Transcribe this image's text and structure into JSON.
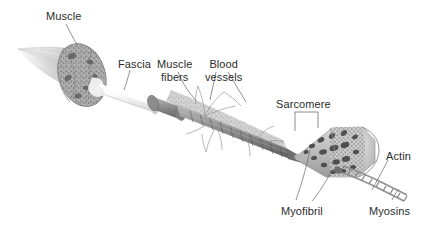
{
  "diagram": {
    "title_visible": false,
    "palette": {
      "background": "#ffffff",
      "text": "#2b2b2b",
      "leader_line": "#6e6e6e",
      "muscle_light": "#d9d9d9",
      "muscle_mid": "#b4b4b4",
      "muscle_dark": "#8a8a8a",
      "muscle_darkest": "#5e5e5e",
      "fascia": "#f2f2f2",
      "myofibril_blob": "#4f4f4f",
      "filament": "#9a9a9a"
    },
    "labels": [
      {
        "id": "muscle",
        "text": "Muscle",
        "x": 46,
        "y": 10,
        "align": "left"
      },
      {
        "id": "fascia",
        "text": "Fascia",
        "x": 118,
        "y": 58,
        "align": "left"
      },
      {
        "id": "muscle-fibers",
        "text": "Muscle\nfibers",
        "x": 163,
        "y": 58,
        "align": "center"
      },
      {
        "id": "blood-vessels",
        "text": "Blood\nvessels",
        "x": 211,
        "y": 58,
        "align": "center"
      },
      {
        "id": "sarcomere",
        "text": "Sarcomere",
        "x": 276,
        "y": 98,
        "align": "left"
      },
      {
        "id": "actin",
        "text": "Actin",
        "x": 386,
        "y": 150,
        "align": "left"
      },
      {
        "id": "myofibril",
        "text": "Myofibril",
        "x": 288,
        "y": 205,
        "align": "left"
      },
      {
        "id": "myosins",
        "text": "Myosins",
        "x": 372,
        "y": 205,
        "align": "left"
      }
    ],
    "structures": [
      {
        "id": "muscle-belly",
        "label": "Muscle",
        "shape": "tapered-cone-with-cut-end"
      },
      {
        "id": "fascia-sheath",
        "label": "Fascia",
        "shape": "pale-cylinder"
      },
      {
        "id": "fiber-bundle",
        "label": "Muscle fibers",
        "shape": "striated-bundle"
      },
      {
        "id": "blood-vessel-net",
        "label": "Blood vessels",
        "shape": "branching-filaments"
      },
      {
        "id": "myofibril-cylinder",
        "label": "Myofibril",
        "shape": "blobbed-dotted-cylinder"
      },
      {
        "id": "sarcomere-segment",
        "label": "Sarcomere",
        "shape": "bracketed-segment"
      },
      {
        "id": "filament-strand",
        "label": "Actin / Myosins",
        "shape": "helical-ladder"
      }
    ]
  }
}
